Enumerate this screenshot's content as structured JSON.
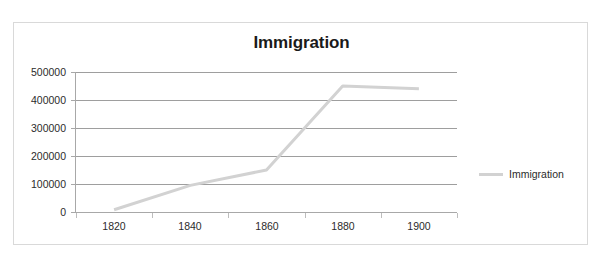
{
  "clipped_header": {
    "ghost_text": "· · ·   ·   · ·",
    "ghost_right": "·"
  },
  "chart_frame": {
    "border_color": "#d9d9d9",
    "background": "#ffffff"
  },
  "legend": {
    "position": "right",
    "entries": [
      {
        "label": "Immigration",
        "color": "#d2d2d2"
      }
    ]
  },
  "chart_data": {
    "type": "line",
    "title": "Immigration",
    "xlabel": "",
    "ylabel": "",
    "categories": [
      "1820",
      "1840",
      "1860",
      "1880",
      "1900"
    ],
    "series": [
      {
        "name": "Immigration",
        "color": "#d2d2d2",
        "values": [
          8000,
          95000,
          150000,
          450000,
          440000
        ]
      }
    ],
    "ylim": [
      0,
      500000
    ],
    "ytick_labels": [
      "0",
      "100000",
      "200000",
      "300000",
      "400000",
      "500000"
    ],
    "ytick_values": [
      0,
      100000,
      200000,
      300000,
      400000,
      500000
    ],
    "xtick_labels": [
      "1820",
      "1840",
      "1860",
      "1880",
      "1900"
    ],
    "grid": true,
    "grid_color": "#9e9e9e",
    "legend_position": "right"
  }
}
